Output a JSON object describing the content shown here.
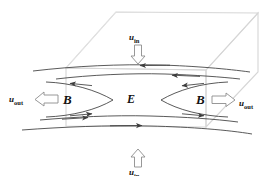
{
  "figure": {
    "kind": "magnetic-reconnection-schematic",
    "background_color": "#ffffff",
    "line_color": "#3c3c3c",
    "box_color": "#d8d8d8",
    "text_color": "#111111",
    "width": 274,
    "height": 176
  },
  "labels": {
    "inflow_top": {
      "symbol": "u",
      "subscript": "in",
      "text": "u"
    },
    "inflow_bottom": {
      "symbol": "u",
      "subscript": "in",
      "text": "u"
    },
    "outflow_left": {
      "symbol": "u",
      "subscript": "out",
      "text": "u"
    },
    "outflow_right": {
      "symbol": "u",
      "subscript": "out",
      "text": "u"
    },
    "field_left": "B",
    "field_right": "B",
    "electric_field": "E"
  },
  "subscripts": {
    "in": "in",
    "out": "out"
  },
  "arrows": {
    "inflow_top_direction": "down",
    "inflow_bottom_direction": "up",
    "outflow_left_direction": "left",
    "outflow_right_direction": "right",
    "style": "hollow-block-arrow"
  },
  "field_lines": {
    "description": "X-point separatrix with inflowing field lines above and below the current sheet and outflow to left and right",
    "count_top": 2,
    "count_bottom": 2,
    "separatrix_count": 2
  },
  "box": {
    "description": "3D parallelepiped diffusion region drawn in light grey",
    "faces": [
      "top",
      "front",
      "right"
    ]
  }
}
